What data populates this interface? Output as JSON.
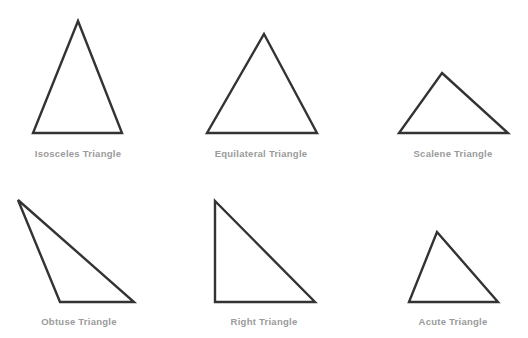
{
  "figure": {
    "background_color": "#ffffff",
    "stroke_color": "#333333",
    "label_color": "#9b9b9b",
    "width": 528,
    "height": 338,
    "items": [
      {
        "id": "isosceles",
        "label": "Isosceles Triangle",
        "points": "78,21 122,133 33,133",
        "label_x": 78,
        "label_y": 148
      },
      {
        "id": "equilateral",
        "label": "Equilateral Triangle",
        "points": "264,34 317,133 207,133",
        "label_x": 261,
        "label_y": 148
      },
      {
        "id": "scalene",
        "label": "Scalene Triangle",
        "points": "442,73 508,133 399,133",
        "label_x": 453,
        "label_y": 148
      },
      {
        "id": "obtuse",
        "label": "Obtuse Triangle",
        "points": "18,200 134,302 60,302",
        "label_x": 79,
        "label_y": 316
      },
      {
        "id": "right",
        "label": "Right Triangle",
        "points": "215,201 315,302 215,302",
        "label_x": 264,
        "label_y": 316
      },
      {
        "id": "acute",
        "label": "Acute Triangle",
        "points": "437,232 498,302 409,302",
        "label_x": 453,
        "label_y": 316
      }
    ]
  }
}
